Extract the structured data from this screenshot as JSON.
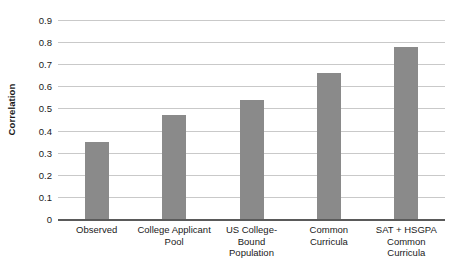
{
  "chart_data": {
    "type": "bar",
    "title": "",
    "xlabel": "",
    "ylabel": "Correlation",
    "categories": [
      "Observed",
      "College Applicant Pool",
      "US College-Bound Population",
      "Common Curricula",
      "SAT + HSGPA Common Curricula"
    ],
    "category_lines": [
      [
        "Observed"
      ],
      [
        "College Applicant",
        "Pool"
      ],
      [
        "US College-",
        "Bound",
        "Population"
      ],
      [
        "Common",
        "Curricula"
      ],
      [
        "SAT + HSGPA",
        "Common",
        "Curricula"
      ]
    ],
    "values": [
      0.35,
      0.47,
      0.54,
      0.66,
      0.78
    ],
    "ylim": [
      0,
      0.9
    ],
    "ytick_labels": [
      "0",
      "0.1",
      "0.2",
      "0.3",
      "0.4",
      "0.5",
      "0.6",
      "0.7",
      "0.8",
      "0.9"
    ],
    "ytick_values": [
      0,
      0.1,
      0.2,
      0.3,
      0.4,
      0.5,
      0.6,
      0.7,
      0.8,
      0.9
    ],
    "grid": true,
    "legend": "none",
    "bar_color": "#8a8a8a",
    "gridline_color": "#c9c9c9",
    "axis_color": "#5a5a5a"
  }
}
